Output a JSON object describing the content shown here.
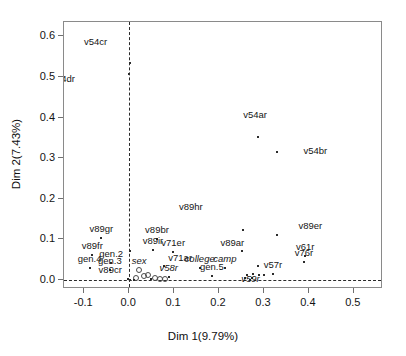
{
  "chart_data": {
    "type": "scatter",
    "title": "",
    "xlabel": "Dim 1(9.79%)",
    "ylabel": "Dim 2(7.43%)",
    "xlim": [
      -0.145,
      0.565
    ],
    "ylim": [
      -0.022,
      0.635
    ],
    "xticks": [
      -0.1,
      0.0,
      0.1,
      0.2,
      0.3,
      0.4,
      0.5
    ],
    "xticklabels": [
      "-0.1",
      "0.0",
      "0.1",
      "0.2",
      "0.3",
      "0.4",
      "0.5"
    ],
    "yticks": [
      0.0,
      0.1,
      0.2,
      0.3,
      0.4,
      0.5,
      0.6
    ],
    "yticklabels": [
      "0.0",
      "0.1",
      "0.2",
      "0.3",
      "0.4",
      "0.5",
      "0.6"
    ],
    "grid": false,
    "legend": "none",
    "reference_lines": [
      {
        "axis": "horizontal",
        "value": 0.0,
        "style": "dashed"
      },
      {
        "axis": "vertical",
        "value": 0.0,
        "style": "dashed"
      }
    ],
    "points": [
      {
        "label": "v54cr",
        "x": 0.001,
        "y": 0.533,
        "marker": "point",
        "label_dx": -34,
        "label_dy": -12,
        "italic": false
      },
      {
        "label": "v54dr",
        "x": 0.0,
        "y": 0.508,
        "marker": "point",
        "label_dx": -66,
        "label_dy": 14,
        "italic": false
      },
      {
        "label": "v54ar",
        "x": 0.287,
        "y": 0.352,
        "marker": "point",
        "label_dx": -3,
        "label_dy": -13,
        "italic": false
      },
      {
        "label": "v54br",
        "x": 0.33,
        "y": 0.316,
        "marker": "point",
        "label_dx": 38,
        "label_dy": 8,
        "italic": false
      },
      {
        "label": "v89hr",
        "x": 0.253,
        "y": 0.124,
        "marker": "point",
        "label_dx": -52,
        "label_dy": -14,
        "italic": false
      },
      {
        "label": "v89er",
        "x": 0.33,
        "y": 0.112,
        "marker": "point",
        "label_dx": 33,
        "label_dy": 0,
        "italic": false
      },
      {
        "label": "v89gr",
        "x": -0.062,
        "y": 0.104,
        "marker": "point",
        "label_dx": 0,
        "label_dy": 0,
        "italic": false
      },
      {
        "label": "v89br",
        "x": 0.062,
        "y": 0.101,
        "marker": "point",
        "label_dx": 0,
        "label_dy": 0,
        "italic": false
      },
      {
        "label": "v89ir",
        "x": 0.053,
        "y": 0.073,
        "marker": "point",
        "label_dx": 0,
        "label_dy": 0,
        "italic": false
      },
      {
        "label": "v89ar",
        "x": 0.252,
        "y": 0.072,
        "marker": "point",
        "label_dx": -10,
        "label_dy": 1,
        "italic": false
      },
      {
        "label": "v71er",
        "x": 0.098,
        "y": 0.07,
        "marker": "point",
        "label_dx": 0,
        "label_dy": 0,
        "italic": false
      },
      {
        "label": "v89fr",
        "x": -0.082,
        "y": 0.062,
        "marker": "point",
        "label_dx": 0,
        "label_dy": 0,
        "italic": false
      },
      {
        "label": "v61r",
        "x": 0.392,
        "y": 0.06,
        "marker": "point",
        "label_dx": 0,
        "label_dy": 0,
        "italic": false
      },
      {
        "label": "v76r",
        "x": 0.389,
        "y": 0.044,
        "marker": "point",
        "label_dx": 0,
        "label_dy": 0,
        "italic": false
      },
      {
        "label": "gen.2",
        "x": -0.04,
        "y": 0.043,
        "marker": "point",
        "label_dx": 0,
        "label_dy": 0,
        "italic": false
      },
      {
        "label": "v71ar",
        "x": 0.078,
        "y": 0.035,
        "marker": "point",
        "label_dx": 16,
        "label_dy": 1,
        "italic": false
      },
      {
        "label": "gen.4",
        "x": -0.088,
        "y": 0.029,
        "marker": "point",
        "label_dx": 0,
        "label_dy": 0,
        "italic": false
      },
      {
        "label": "gen.3",
        "x": -0.043,
        "y": 0.024,
        "marker": "point",
        "label_dx": 0,
        "label_dy": 0,
        "italic": false
      },
      {
        "label": "college",
        "x": 0.157,
        "y": 0.03,
        "marker": "point",
        "label_dx": 0,
        "label_dy": 0,
        "italic": true
      },
      {
        "label": "camp",
        "x": 0.213,
        "y": 0.03,
        "marker": "point",
        "label_dx": 0,
        "label_dy": 0,
        "italic": true
      },
      {
        "label": "sex",
        "x": 0.022,
        "y": 0.024,
        "marker": "circle",
        "label_dx": 0,
        "label_dy": 0,
        "italic": true
      },
      {
        "label": "v57r",
        "x": 0.32,
        "y": 0.014,
        "marker": "point",
        "label_dx": 0,
        "label_dy": 0,
        "italic": false
      },
      {
        "label": "gen.5",
        "x": 0.184,
        "y": 0.011,
        "marker": "point",
        "label_dx": 0,
        "label_dy": 0,
        "italic": false
      },
      {
        "label": "v58r",
        "x": 0.088,
        "y": 0.008,
        "marker": "point",
        "label_dx": 0,
        "label_dy": 0,
        "italic": true
      },
      {
        "label": "v59r",
        "x": 0.27,
        "y": -0.001,
        "marker": "point",
        "label_dx": 0,
        "label_dy": 8,
        "italic": true
      },
      {
        "label": "v89cr",
        "x": -0.002,
        "y": 0.002,
        "marker": "point",
        "label_dx": -18,
        "label_dy": 0,
        "italic": false
      }
    ],
    "extra_markers": [
      {
        "x": 0.002,
        "y": 0.072,
        "marker": "point"
      },
      {
        "x": 0.042,
        "y": 0.012,
        "marker": "circle"
      },
      {
        "x": 0.032,
        "y": 0.009,
        "marker": "circle"
      },
      {
        "x": 0.015,
        "y": 0.004,
        "marker": "circle"
      },
      {
        "x": 0.058,
        "y": 0.004,
        "marker": "circle"
      },
      {
        "x": 0.068,
        "y": 0.003,
        "marker": "circle"
      },
      {
        "x": 0.079,
        "y": 0.003,
        "marker": "circle"
      },
      {
        "x": 0.003,
        "y": 0.001,
        "marker": "point"
      },
      {
        "x": 0.01,
        "y": 0.001,
        "marker": "point"
      },
      {
        "x": 0.048,
        "y": 0.002,
        "marker": "point"
      },
      {
        "x": 0.262,
        "y": 0.012,
        "marker": "point"
      },
      {
        "x": 0.276,
        "y": 0.014,
        "marker": "point"
      },
      {
        "x": 0.29,
        "y": 0.013,
        "marker": "point"
      },
      {
        "x": 0.3,
        "y": 0.012,
        "marker": "point"
      },
      {
        "x": 0.258,
        "y": 0.005,
        "marker": "point"
      },
      {
        "x": 0.273,
        "y": 0.006,
        "marker": "point"
      },
      {
        "x": 0.287,
        "y": 0.035,
        "marker": "point"
      }
    ]
  },
  "colors": {
    "background": "#ffffff",
    "box": "#8a8a8a",
    "point": "#2b2b2b",
    "text": "#141414",
    "reference_line": "#2a2a2a"
  }
}
